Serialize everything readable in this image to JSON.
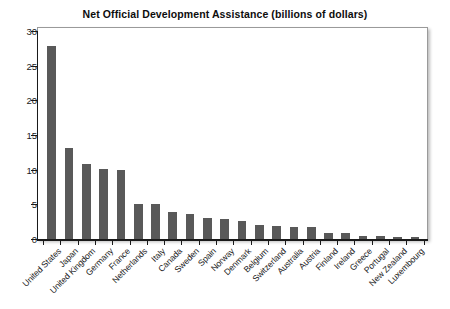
{
  "chart_data": {
    "type": "bar",
    "title": "Net Official Development Assistance (billions of dollars)",
    "xlabel": "",
    "ylabel": "",
    "ylim": [
      0,
      30
    ],
    "yticks": [
      0,
      5,
      10,
      15,
      20,
      25,
      30
    ],
    "ytick_labels": [
      "0",
      "5",
      "10",
      "15",
      "20",
      "25",
      "30"
    ],
    "grid": false,
    "legend": "none",
    "bar_color": "#595959",
    "categories": [
      "United States",
      "Japan",
      "United Kingdom",
      "Germany",
      "France",
      "Netherlands",
      "Italy",
      "Canada",
      "Sweden",
      "Spain",
      "Norway",
      "Denmark",
      "Belgium",
      "Switzerland",
      "Australia",
      "Austria",
      "Finland",
      "Ireland",
      "Greece",
      "Portugal",
      "New Zealand",
      "Luxembourg"
    ],
    "values": [
      27.8,
      13.1,
      10.8,
      10.1,
      10.0,
      5.1,
      5.1,
      3.9,
      3.6,
      3.1,
      2.9,
      2.6,
      2.0,
      1.9,
      1.7,
      1.7,
      0.9,
      0.8,
      0.5,
      0.4,
      0.3,
      0.3
    ]
  }
}
